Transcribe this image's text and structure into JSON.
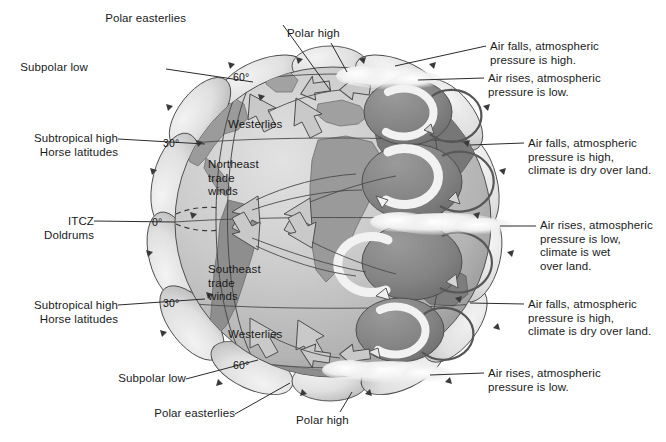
{
  "figure": {
    "width": 666,
    "height": 442,
    "background": "#ffffff"
  },
  "colors": {
    "ocean_light": "#cfcfcf",
    "ocean_mid": "#b8b8b8",
    "land_light": "#a8a8a8",
    "land_dark": "#8a8a8a",
    "cell_dark": "#777777",
    "pressure_blob": "#e2e2e2",
    "cloud": "#f0f0f0",
    "outline": "#3a3a3a",
    "text": "#1a1a1a",
    "leader_line": "#2b2b2b",
    "arrow_fill": "#c9c9c9",
    "arrow_white": "#f2f2f2"
  },
  "latitude_labels": [
    {
      "id": "lat-60n",
      "text": "60°",
      "x": 233,
      "y": 71
    },
    {
      "id": "lat-30n",
      "text": "30°",
      "x": 163,
      "y": 137
    },
    {
      "id": "lat-0",
      "text": "0°",
      "x": 152,
      "y": 216
    },
    {
      "id": "lat-30s",
      "text": "30°",
      "x": 163,
      "y": 297
    },
    {
      "id": "lat-60s",
      "text": "60°",
      "x": 233,
      "y": 359
    }
  ],
  "globe_labels": [
    {
      "id": "westerlies-north",
      "text": "Westerlies",
      "x": 228,
      "y": 118
    },
    {
      "id": "northeast-trade-winds",
      "text": "Northeast\ntrade\nwinds",
      "x": 208,
      "y": 158
    },
    {
      "id": "southeast-trade-winds",
      "text": "Southeast\ntrade\nwinds",
      "x": 208,
      "y": 263
    },
    {
      "id": "westerlies-south",
      "text": "Westerlies",
      "x": 228,
      "y": 328
    }
  ],
  "callouts": {
    "left": [
      {
        "id": "polar-easterlies-top",
        "text": "Polar easterlies",
        "text_x": 186,
        "text_y": 12,
        "line": [
          [
            283,
            25
          ],
          [
            330,
            90
          ]
        ]
      },
      {
        "id": "subpolar-low-top",
        "text": "Subpolar low",
        "text_x": 88,
        "text_y": 61,
        "line": [
          [
            166,
            69
          ],
          [
            253,
            82
          ]
        ]
      },
      {
        "id": "subtropical-high-north",
        "text": "Subtropical high\nHorse latitudes",
        "text_x": 18,
        "text_y": 132,
        "line": [
          [
            118,
            139
          ],
          [
            205,
            144
          ]
        ]
      },
      {
        "id": "itcz-doldrums",
        "text": "ITCZ\nDoldrums",
        "text_x": 48,
        "text_y": 215,
        "line": [
          [
            94,
            221
          ],
          [
            175,
            222
          ]
        ]
      },
      {
        "id": "subtropical-high-south",
        "text": "Subtropical high\nHorse latitudes",
        "text_x": 18,
        "text_y": 299,
        "line": [
          [
            118,
            305
          ],
          [
            205,
            299
          ]
        ]
      },
      {
        "id": "subpolar-low-bottom",
        "text": "Subpolar low",
        "text_x": 108,
        "text_y": 372,
        "line": [
          [
            186,
            379
          ],
          [
            258,
            360
          ]
        ]
      },
      {
        "id": "polar-easterlies-bottom",
        "text": "Polar easterlies",
        "text_x": 147,
        "text_y": 413,
        "line": [
          [
            235,
            414
          ],
          [
            290,
            383
          ]
        ]
      }
    ],
    "center": [
      {
        "id": "polar-high-top",
        "text": "Polar high",
        "text_x": 287,
        "text_y": 27,
        "line": [
          [
            331,
            43
          ],
          [
            347,
            72
          ]
        ]
      },
      {
        "id": "polar-high-bottom",
        "text": "Polar high",
        "text_x": 296,
        "text_y": 414,
        "line": [
          [
            340,
            412
          ],
          [
            352,
            392
          ]
        ]
      }
    ],
    "right": [
      {
        "id": "air-falls-polar-north",
        "text": "Air falls, atmospheric\npressure is high.",
        "text_x": 490,
        "text_y": 40,
        "line": [
          [
            395,
            66
          ],
          [
            486,
            46
          ]
        ]
      },
      {
        "id": "air-rises-subpolar-north",
        "text": "Air rises, atmospheric\npressure is low.",
        "text_x": 488,
        "text_y": 72,
        "line": [
          [
            418,
            82
          ],
          [
            484,
            78
          ]
        ]
      },
      {
        "id": "air-falls-subtropical-north",
        "text": "Air falls, atmospheric\npressure is high,\nclimate is dry over land.",
        "text_x": 528,
        "text_y": 137,
        "line": [
          [
            470,
            145
          ],
          [
            524,
            143
          ]
        ]
      },
      {
        "id": "air-rises-equator",
        "text": "Air rises, atmospheric\npressure is low,\nclimate is wet\nover land.",
        "text_x": 540,
        "text_y": 219,
        "line": [
          [
            516,
            225
          ],
          [
            536,
            225
          ]
        ]
      },
      {
        "id": "air-falls-subtropical-south",
        "text": "Air falls, atmospheric\npressure is high,\nclimate is dry over land.",
        "text_x": 528,
        "text_y": 298,
        "line": [
          [
            470,
            303
          ],
          [
            524,
            304
          ]
        ]
      },
      {
        "id": "air-rises-subpolar-south",
        "text": "Air rises, atmospheric\npressure is low.",
        "text_x": 488,
        "text_y": 367,
        "line": [
          [
            430,
            375
          ],
          [
            484,
            373
          ]
        ]
      }
    ]
  },
  "diagram_data": {
    "type": "diagram",
    "subject": "Earth's general atmospheric circulation",
    "wind_belts": [
      {
        "name": "Polar easterlies",
        "hemisphere": "north",
        "latitude_band": "60°–90° N"
      },
      {
        "name": "Westerlies",
        "hemisphere": "north",
        "latitude_band": "30°–60° N"
      },
      {
        "name": "Northeast trade winds",
        "hemisphere": "north",
        "latitude_band": "0°–30° N"
      },
      {
        "name": "Southeast trade winds",
        "hemisphere": "south",
        "latitude_band": "0°–30° S"
      },
      {
        "name": "Westerlies",
        "hemisphere": "south",
        "latitude_band": "30°–60° S"
      },
      {
        "name": "Polar easterlies",
        "hemisphere": "south",
        "latitude_band": "60°–90° S"
      }
    ],
    "pressure_belts": [
      {
        "name": "Polar high",
        "latitude": "90° N",
        "pressure": "high",
        "motion": "air falls"
      },
      {
        "name": "Subpolar low",
        "latitude": "60° N",
        "pressure": "low",
        "motion": "air rises"
      },
      {
        "name": "Subtropical high / Horse latitudes",
        "latitude": "30° N",
        "pressure": "high",
        "motion": "air falls"
      },
      {
        "name": "ITCZ / Doldrums",
        "latitude": "0°",
        "pressure": "low",
        "motion": "air rises"
      },
      {
        "name": "Subtropical high / Horse latitudes",
        "latitude": "30° S",
        "pressure": "high",
        "motion": "air falls"
      },
      {
        "name": "Subpolar low",
        "latitude": "60° S",
        "pressure": "low",
        "motion": "air rises"
      },
      {
        "name": "Polar high",
        "latitude": "90° S",
        "pressure": "high",
        "motion": "air falls"
      }
    ]
  }
}
